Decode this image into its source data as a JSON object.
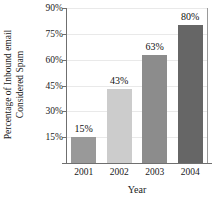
{
  "chart_data": {
    "type": "bar",
    "title": "",
    "categories": [
      "2001",
      "2002",
      "2003",
      "2004"
    ],
    "values": [
      15,
      43,
      63,
      80
    ],
    "value_labels": [
      "15%",
      "43%",
      "63%",
      "80%"
    ],
    "bar_colors": [
      "#999999",
      "#cccccc",
      "#8c8c8c",
      "#666666"
    ],
    "xlabel": "Year",
    "ylabel_line1": "Percentage of Inbound email",
    "ylabel_line2": "Considered Spam",
    "ylim": [
      0,
      90
    ],
    "yticks": [
      15,
      30,
      45,
      60,
      75,
      90
    ],
    "ytick_labels": [
      "15%",
      "30%",
      "45%",
      "60%",
      "75%",
      "90%"
    ],
    "grid": true,
    "legend": false
  }
}
